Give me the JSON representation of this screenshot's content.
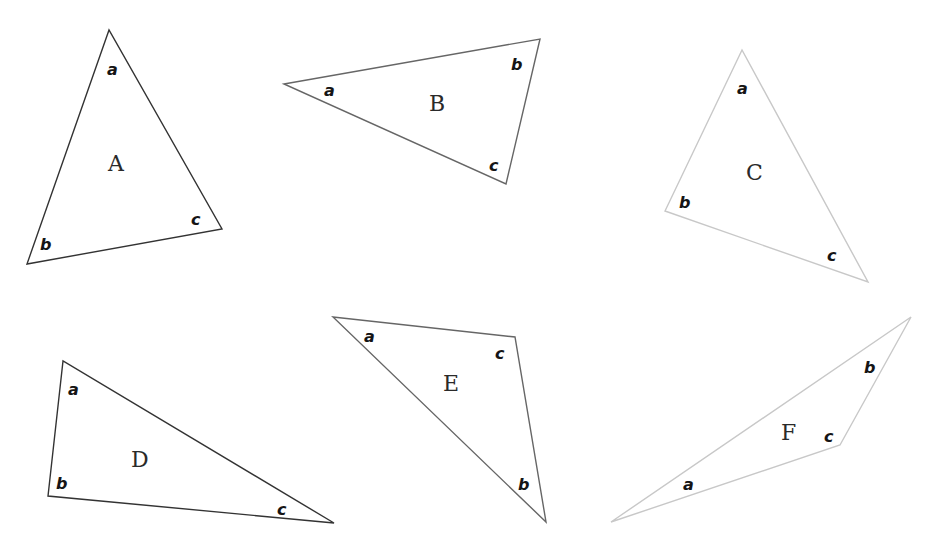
{
  "diagram": {
    "triangles": [
      {
        "name": "A",
        "stroke": "#333333",
        "points": "109,30 27,264 222,229",
        "name_pos": [
          116,
          171
        ],
        "angles": [
          {
            "label": "a",
            "pos": [
              108,
              75
            ]
          },
          {
            "label": "b",
            "pos": [
              42,
              249
            ]
          },
          {
            "label": "c",
            "pos": [
              192,
              224
            ]
          }
        ]
      },
      {
        "name": "B",
        "stroke": "#666666",
        "points": "284,84 540,39 506,184",
        "name_pos": [
          437,
          111
        ],
        "angles": [
          {
            "label": "a",
            "pos": [
              325,
              95
            ]
          },
          {
            "label": "b",
            "pos": [
              512,
              69
            ]
          },
          {
            "label": "c",
            "pos": [
              490,
              170
            ]
          }
        ]
      },
      {
        "name": "C",
        "stroke": "#c8c8c8",
        "points": "742,50 665,211 868,282",
        "name_pos": [
          755,
          180
        ],
        "angles": [
          {
            "label": "a",
            "pos": [
              738,
              94
            ]
          },
          {
            "label": "b",
            "pos": [
              680,
              208
            ]
          },
          {
            "label": "c",
            "pos": [
              828,
              261
            ]
          }
        ]
      },
      {
        "name": "D",
        "stroke": "#333333",
        "points": "63,361 48,496 334,523",
        "name_pos": [
          140,
          467
        ],
        "angles": [
          {
            "label": "a",
            "pos": [
              69,
              395
            ]
          },
          {
            "label": "b",
            "pos": [
              57,
              489
            ]
          },
          {
            "label": "c",
            "pos": [
              278,
              515
            ]
          }
        ]
      },
      {
        "name": "E",
        "stroke": "#666666",
        "points": "333,317 515,337 546,522",
        "name_pos": [
          451,
          391
        ],
        "angles": [
          {
            "label": "a",
            "pos": [
              365,
              342
            ]
          },
          {
            "label": "c",
            "pos": [
              496,
              359
            ]
          },
          {
            "label": "b",
            "pos": [
              519,
              490
            ]
          }
        ]
      },
      {
        "name": "F",
        "stroke": "#c8c8c8",
        "points": "911,317 840,445 611,522",
        "name_pos": [
          789,
          440
        ],
        "angles": [
          {
            "label": "b",
            "pos": [
              865,
              373
            ]
          },
          {
            "label": "c",
            "pos": [
              825,
              442
            ]
          },
          {
            "label": "a",
            "pos": [
              684,
              490
            ]
          }
        ]
      }
    ]
  }
}
